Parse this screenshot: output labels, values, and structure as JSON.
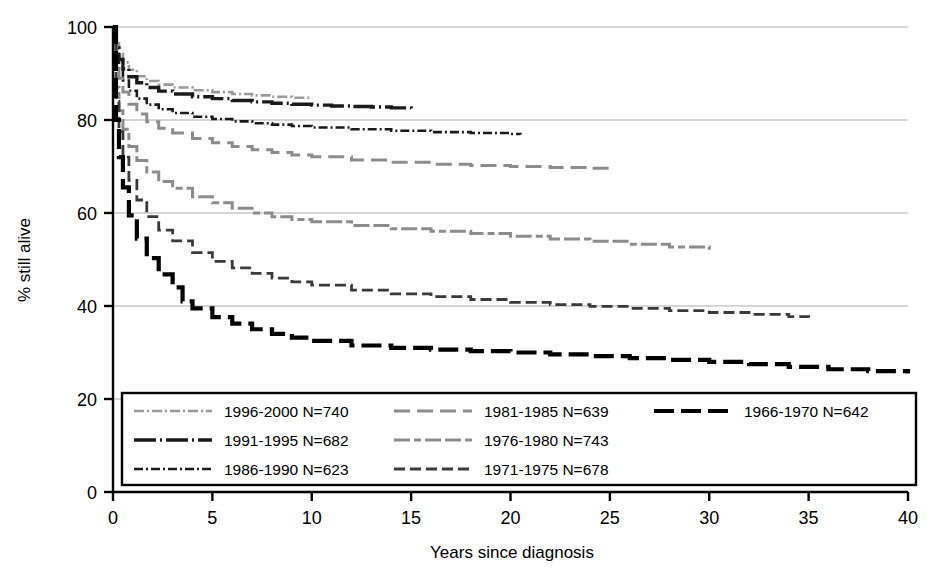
{
  "chart_data": {
    "type": "line",
    "title": "",
    "xlabel": "Years since diagnosis",
    "ylabel": "% still alive",
    "xlim": [
      0,
      40
    ],
    "ylim": [
      0,
      100
    ],
    "xticks": [
      0,
      5,
      10,
      15,
      20,
      25,
      30,
      35,
      40
    ],
    "yticks": [
      0,
      20,
      40,
      60,
      80,
      100
    ],
    "xtick_labels": [
      "0",
      "5",
      "10",
      "15",
      "20",
      "25",
      "30",
      "35",
      "40"
    ],
    "ytick_labels": [
      "0",
      "20",
      "40",
      "60",
      "80",
      "100"
    ],
    "grid": "horizontal",
    "legend_position": "lower-left-inside",
    "series": [
      {
        "name": "1996-2000",
        "n": 740,
        "legend_label": "1996-2000 N=740",
        "color": "#9a9a9a",
        "dash": "10,3,2,3,10,3,2,3",
        "width": 2.6,
        "points": [
          [
            0,
            100
          ],
          [
            0.15,
            96.5
          ],
          [
            0.3,
            94.2
          ],
          [
            0.5,
            92.4
          ],
          [
            0.8,
            90.8
          ],
          [
            1.2,
            89.4
          ],
          [
            1.7,
            88.4
          ],
          [
            2.3,
            87.6
          ],
          [
            3,
            87.0
          ],
          [
            4,
            86.4
          ],
          [
            5,
            86.0
          ],
          [
            6,
            85.6
          ],
          [
            7,
            85.3
          ],
          [
            8,
            85.0
          ],
          [
            9,
            84.8
          ],
          [
            10,
            84.6
          ]
        ]
      },
      {
        "name": "1991-1995",
        "n": 682,
        "legend_label": "1991-1995 N=682",
        "color": "#1a1a1a",
        "dash": "22,4,2,4",
        "width": 3.4,
        "points": [
          [
            0,
            100
          ],
          [
            0.15,
            95.5
          ],
          [
            0.3,
            93.0
          ],
          [
            0.5,
            91.0
          ],
          [
            0.8,
            89.3
          ],
          [
            1.2,
            88.0
          ],
          [
            1.7,
            87.0
          ],
          [
            2.3,
            86.2
          ],
          [
            3,
            85.6
          ],
          [
            4,
            85.0
          ],
          [
            5,
            84.6
          ],
          [
            6,
            84.2
          ],
          [
            7,
            83.9
          ],
          [
            8,
            83.6
          ],
          [
            9,
            83.4
          ],
          [
            10,
            83.2
          ],
          [
            11,
            83.0
          ],
          [
            12,
            82.9
          ],
          [
            13,
            82.8
          ],
          [
            14,
            82.6
          ],
          [
            15,
            82.5
          ]
        ]
      },
      {
        "name": "1986-1990",
        "n": 623,
        "legend_label": "1986-1990 N=623",
        "color": "#1a1a1a",
        "dash": "9,3,2,3",
        "width": 2.6,
        "points": [
          [
            0,
            100
          ],
          [
            0.15,
            94.0
          ],
          [
            0.3,
            91.0
          ],
          [
            0.5,
            88.5
          ],
          [
            0.8,
            86.3
          ],
          [
            1.2,
            84.6
          ],
          [
            1.7,
            83.3
          ],
          [
            2.3,
            82.3
          ],
          [
            3,
            81.5
          ],
          [
            4,
            80.7
          ],
          [
            5,
            80.2
          ],
          [
            6,
            79.7
          ],
          [
            7,
            79.3
          ],
          [
            8,
            79.0
          ],
          [
            9,
            78.7
          ],
          [
            10,
            78.4
          ],
          [
            12,
            78.0
          ],
          [
            14,
            77.7
          ],
          [
            16,
            77.4
          ],
          [
            18,
            77.2
          ],
          [
            20,
            77.0
          ],
          [
            20.5,
            76.9
          ]
        ]
      },
      {
        "name": "1981-1985",
        "n": 639,
        "legend_label": "1981-1985 N=639",
        "color": "#8c8c8c",
        "dash": "16,7",
        "width": 3.0,
        "points": [
          [
            0,
            100
          ],
          [
            0.15,
            92.5
          ],
          [
            0.3,
            89.0
          ],
          [
            0.5,
            86.0
          ],
          [
            0.8,
            83.4
          ],
          [
            1.2,
            81.3
          ],
          [
            1.7,
            79.6
          ],
          [
            2.3,
            78.2
          ],
          [
            3,
            77.2
          ],
          [
            4,
            76.0
          ],
          [
            5,
            75.1
          ],
          [
            6,
            74.3
          ],
          [
            7,
            73.6
          ],
          [
            8,
            73.0
          ],
          [
            9,
            72.5
          ],
          [
            10,
            72.1
          ],
          [
            12,
            71.4
          ],
          [
            14,
            70.9
          ],
          [
            16,
            70.5
          ],
          [
            18,
            70.2
          ],
          [
            20,
            70.0
          ],
          [
            22,
            69.8
          ],
          [
            24,
            69.6
          ],
          [
            25,
            69.5
          ]
        ]
      },
      {
        "name": "1976-1980",
        "n": 743,
        "legend_label": "1976-1980 N=743",
        "color": "#8c8c8c",
        "dash": "16,4,7,4,16,4",
        "width": 3.0,
        "points": [
          [
            0,
            100
          ],
          [
            0.15,
            87.0
          ],
          [
            0.3,
            82.0
          ],
          [
            0.5,
            78.0
          ],
          [
            0.8,
            74.3
          ],
          [
            1.2,
            71.3
          ],
          [
            1.7,
            68.8
          ],
          [
            2.3,
            66.8
          ],
          [
            3,
            65.3
          ],
          [
            4,
            63.5
          ],
          [
            5,
            62.2
          ],
          [
            6,
            61.0
          ],
          [
            7,
            60.0
          ],
          [
            8,
            59.2
          ],
          [
            9,
            58.6
          ],
          [
            10,
            58.1
          ],
          [
            12,
            57.3
          ],
          [
            14,
            56.6
          ],
          [
            16,
            56.1
          ],
          [
            18,
            55.6
          ],
          [
            20,
            55.0
          ],
          [
            22,
            54.4
          ],
          [
            24,
            53.9
          ],
          [
            26,
            53.3
          ],
          [
            28,
            52.7
          ],
          [
            30,
            52.1
          ]
        ]
      },
      {
        "name": "1971-1975",
        "n": 678,
        "legend_label": "1971-1975 N=678",
        "color": "#3a3a3a",
        "dash": "11,5",
        "width": 2.8,
        "points": [
          [
            0,
            100
          ],
          [
            0.15,
            84.0
          ],
          [
            0.3,
            77.5
          ],
          [
            0.5,
            72.0
          ],
          [
            0.8,
            67.0
          ],
          [
            1.2,
            62.8
          ],
          [
            1.7,
            59.2
          ],
          [
            2.3,
            56.3
          ],
          [
            3,
            54.0
          ],
          [
            4,
            51.5
          ],
          [
            5,
            49.6
          ],
          [
            6,
            48.2
          ],
          [
            7,
            47.0
          ],
          [
            8,
            46.0
          ],
          [
            9,
            45.2
          ],
          [
            10,
            44.5
          ],
          [
            12,
            43.4
          ],
          [
            14,
            42.6
          ],
          [
            16,
            42.0
          ],
          [
            18,
            41.4
          ],
          [
            20,
            40.8
          ],
          [
            22,
            40.3
          ],
          [
            24,
            39.9
          ],
          [
            26,
            39.5
          ],
          [
            28,
            39.0
          ],
          [
            30,
            38.6
          ],
          [
            32,
            38.2
          ],
          [
            34,
            37.7
          ],
          [
            35,
            37.5
          ]
        ]
      },
      {
        "name": "1966-1970",
        "n": 642,
        "legend_label": "1966-1970 N=642",
        "color": "#000000",
        "dash": "20,7",
        "width": 4.2,
        "points": [
          [
            0,
            100
          ],
          [
            0.15,
            80.0
          ],
          [
            0.3,
            72.0
          ],
          [
            0.5,
            65.5
          ],
          [
            0.8,
            59.5
          ],
          [
            1.2,
            54.5
          ],
          [
            1.7,
            50.3
          ],
          [
            2.3,
            46.8
          ],
          [
            3,
            44.0
          ],
          [
            3.5,
            41.0
          ],
          [
            4,
            39.5
          ],
          [
            5,
            37.6
          ],
          [
            6,
            36.2
          ],
          [
            7,
            35.0
          ],
          [
            8,
            34.0
          ],
          [
            9,
            33.2
          ],
          [
            10,
            32.5
          ],
          [
            12,
            31.5
          ],
          [
            14,
            31.0
          ],
          [
            16,
            30.6
          ],
          [
            18,
            30.3
          ],
          [
            20,
            30.0
          ],
          [
            22,
            29.6
          ],
          [
            24,
            29.2
          ],
          [
            26,
            28.8
          ],
          [
            28,
            28.4
          ],
          [
            30,
            28.0
          ],
          [
            32,
            27.5
          ],
          [
            34,
            26.9
          ],
          [
            36,
            26.4
          ],
          [
            38,
            26.0
          ],
          [
            40,
            25.5
          ]
        ]
      }
    ]
  },
  "legend": {
    "columns": [
      [
        "1996-2000 N=740",
        "1991-1995 N=682",
        "1986-1990 N=623"
      ],
      [
        "1981-1985 N=639",
        "1976-1980 N=743",
        "1971-1975 N=678"
      ],
      [
        "1966-1970 N=642"
      ]
    ]
  },
  "axes": {
    "y_title": "% still alive",
    "x_title": "Years since diagnosis"
  }
}
